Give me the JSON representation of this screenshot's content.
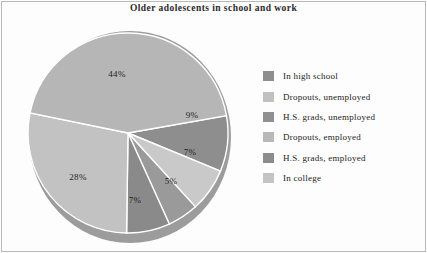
{
  "chart_data": {
    "type": "pie",
    "title": "Older adolescents in school and work",
    "categories": [
      "In high school",
      "Dropouts, unemployed",
      "H.S. grads, unemployed",
      "Dropouts, employed",
      "H.S. grads, employed",
      "In college"
    ],
    "values": [
      44,
      9,
      7,
      5,
      7,
      28
    ],
    "value_labels": [
      "44%",
      "9%",
      "7%",
      "5%",
      "7%",
      "28%"
    ],
    "colors": [
      "#b6b6b6",
      "#8e8e8e",
      "#c9c9c9",
      "#9a9a9a",
      "#8a8a8a",
      "#c2c2c2"
    ],
    "legend_position": "right",
    "grid": false,
    "start_angle_deg": -10,
    "draw_direction": "clockwise",
    "separator_color": "#ffffff",
    "shadow_color": "#9c9c9c"
  },
  "title": {
    "text": "Older adolescents in school and work"
  },
  "slices": [
    {
      "label": "44%",
      "name": "in-high-school",
      "value": 44,
      "color": "#b6b6b6",
      "lx": 117,
      "ly": 61
    },
    {
      "label": "9%",
      "name": "dropouts-unemployed",
      "value": 9,
      "color": "#8e8e8e",
      "lx": 192,
      "ly": 102
    },
    {
      "label": "7%",
      "name": "hs-grads-unemployed",
      "value": 7,
      "color": "#c9c9c9",
      "lx": 190,
      "ly": 139
    },
    {
      "label": "5%",
      "name": "dropouts-employed",
      "value": 5,
      "color": "#9a9a9a",
      "lx": 171,
      "ly": 168
    },
    {
      "label": "7%",
      "name": "hs-grads-employed",
      "value": 7,
      "color": "#8a8a8a",
      "lx": 135,
      "ly": 187
    },
    {
      "label": "28%",
      "name": "in-college",
      "value": 28,
      "color": "#c2c2c2",
      "lx": 78,
      "ly": 164
    }
  ],
  "legend": {
    "items": [
      {
        "label": "In high school",
        "color": "#8e8e8e"
      },
      {
        "label": "Dropouts, unemployed",
        "color": "#c0c0c0"
      },
      {
        "label": "H.S. grads, unemployed",
        "color": "#909090"
      },
      {
        "label": "Dropouts, employed",
        "color": "#b8b8b8"
      },
      {
        "label": "H.S. grads, employed",
        "color": "#8c8c8c"
      },
      {
        "label": "In college",
        "color": "#c4c4c4"
      }
    ]
  }
}
